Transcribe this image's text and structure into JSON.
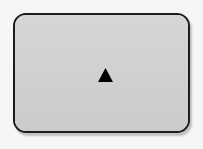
{
  "canvas": {
    "width": 203,
    "height": 149,
    "background_color": "#f6f6f6"
  },
  "panel": {
    "name": "rounded-panel",
    "fill_color": "#d2d2d2",
    "border_color": "#1c1c1c",
    "border_width_px": 2,
    "corner_radius_px": 13,
    "left_px": 13,
    "top_px": 13,
    "width_px": 177,
    "height_px": 120,
    "shadow_color": "#00000038",
    "shadow_offset_x_px": 2,
    "shadow_offset_y_px": 3,
    "label": ""
  },
  "glyph": {
    "name": "triangle-up-icon",
    "shape": "triangle-up",
    "character": "▲",
    "color": "#000000",
    "width_px": 15,
    "height_px": 14,
    "center_x_px": 103,
    "center_y_px": 73,
    "label": ""
  }
}
